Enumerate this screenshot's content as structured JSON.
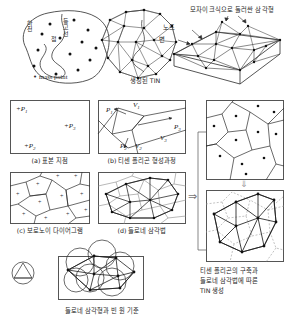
{
  "figure": {
    "title_implicit": "TIN generation process",
    "row1": {
      "panel_a": {
        "name": "contour-mass-point-map",
        "labels": {
          "river": "하천",
          "contour": "등고선",
          "point": "점",
          "legend_marker": "•",
          "legend_text": "mass point"
        }
      },
      "panel_b": {
        "name": "generated-tin-plan",
        "caption": "생성된 TIN"
      },
      "panel_c": {
        "name": "tin-3d-block",
        "caption": "모자이크식으로 둘러싼 삼각형",
        "node_label": "노드",
        "edge_label": "변"
      }
    },
    "row2": {
      "panel_a": {
        "key": "a",
        "caption": "(a) 표본 지점",
        "points": [
          {
            "label": "P",
            "sub": "1",
            "x": 14,
            "y": 16
          },
          {
            "label": "P",
            "sub": "3",
            "x": 62,
            "y": 33
          },
          {
            "label": "P",
            "sub": "2",
            "x": 22,
            "y": 56
          }
        ]
      },
      "panel_b": {
        "key": "b",
        "caption": "(b) 티센 폴리곤 형성과정",
        "point_labels": [
          {
            "label": "P",
            "sub": "1",
            "x": 10,
            "y": 10
          },
          {
            "label": "P",
            "sub": "3",
            "x": 74,
            "y": 28
          },
          {
            "label": "P",
            "sub": "2",
            "x": 23,
            "y": 57
          }
        ],
        "vertex_labels": [
          {
            "label": "V",
            "sub": "1",
            "x": 36,
            "y": 4
          },
          {
            "label": "V",
            "sub": "2",
            "x": 37,
            "y": 57
          },
          {
            "label": "V",
            "sub": "3",
            "x": 62,
            "y": 45
          }
        ]
      },
      "panel_c": {
        "key": "c",
        "caption": "(c) 보로노이 다이어그램"
      },
      "panel_d": {
        "key": "d",
        "caption": "(d) 들로네 삼각법"
      }
    },
    "row3": {
      "panel_circle_small": {
        "name": "single-circumcircle-triangle"
      },
      "panel_empty_circle": {
        "name": "delaunay-empty-circle-criterion",
        "caption": "들로네 삼각형과 빈 원 기준"
      }
    },
    "right_column": {
      "panel_voronoi": {
        "name": "thiessen-polygon-result"
      },
      "panel_overlay": {
        "name": "delaunay-over-thiessen-overlay"
      },
      "caption_lines": [
        "티센 폴리곤의 구축과",
        "들로네 삼각법에 따른",
        "TIN 생성"
      ],
      "arrow_between": "⇒",
      "arrow_down": "⇓"
    }
  },
  "colors": {
    "ink": "#1a1a1a",
    "line": "#3a3a3a",
    "frame": "#555555",
    "dashed": "#8a8a8a",
    "background": "#ffffff"
  }
}
